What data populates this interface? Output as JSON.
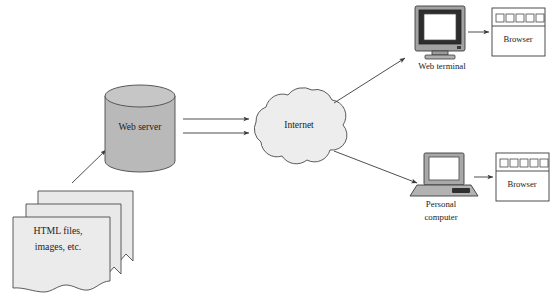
{
  "diagram": {
    "background_color": "#ffffff",
    "line_color": "#3a3a3a",
    "nodes": {
      "documents": {
        "label_line1": "HTML files,",
        "label_line2": "images, etc.",
        "icon": "document-stack-icon",
        "fill": "#e8e8e8",
        "sheets": 3
      },
      "web_server": {
        "label": "Web server",
        "icon": "cylinder-database-icon",
        "fill": "#b9b9b9"
      },
      "internet": {
        "label": "Internet",
        "icon": "cloud-icon",
        "fill": "#ececec"
      },
      "web_terminal": {
        "label": "Web terminal",
        "icon": "crt-monitor-icon",
        "bezel_fill": "#9e9e9e",
        "screen_fill": "#ffffff",
        "frame_fill": "#2b2b2b"
      },
      "personal_computer": {
        "label_line1": "Personal",
        "label_line2": "computer",
        "icon": "laptop-icon",
        "body_fill": "#a8a8a8",
        "screen_fill": "#ffffff",
        "frame_fill": "#555555"
      },
      "browser_top": {
        "label": "Browser",
        "icon": "browser-window-icon",
        "toolbar_buttons": 5,
        "fill": "#ffffff"
      },
      "browser_bottom": {
        "label": "Browser",
        "icon": "browser-window-icon",
        "toolbar_buttons": 5,
        "fill": "#ffffff"
      }
    },
    "connections": [
      {
        "name": "documents-to-web-server",
        "from": "documents",
        "to": "web_server",
        "style": "single-arrow"
      },
      {
        "name": "web-server-to-internet-a",
        "from": "web_server",
        "to": "internet",
        "style": "single-arrow"
      },
      {
        "name": "web-server-to-internet-b",
        "from": "web_server",
        "to": "internet",
        "style": "single-arrow"
      },
      {
        "name": "internet-to-web-terminal",
        "from": "internet",
        "to": "web_terminal",
        "style": "single-arrow"
      },
      {
        "name": "internet-to-personal-computer",
        "from": "internet",
        "to": "personal_computer",
        "style": "single-arrow"
      },
      {
        "name": "web-terminal-to-browser",
        "from": "web_terminal",
        "to": "browser_top",
        "style": "single-arrow"
      },
      {
        "name": "personal-computer-to-browser",
        "from": "personal_computer",
        "to": "browser_bottom",
        "style": "single-arrow"
      }
    ]
  }
}
